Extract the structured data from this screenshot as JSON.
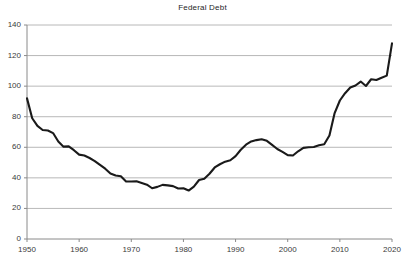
{
  "chart_data": {
    "type": "line",
    "title": "Federal Debt",
    "xlabel": "",
    "ylabel": "",
    "xlim": [
      1950,
      2020
    ],
    "ylim": [
      0,
      140
    ],
    "grid": true,
    "legend": "none",
    "xticks": [
      1950,
      1960,
      1970,
      1980,
      1990,
      2000,
      2010,
      2020
    ],
    "yticks": [
      0,
      20,
      40,
      60,
      80,
      100,
      120,
      140
    ],
    "xtick_labels": [
      "1950",
      "1960",
      "1970",
      "1980",
      "1990",
      "2000",
      "2010",
      "2020"
    ],
    "ytick_labels": [
      "0",
      "20",
      "40",
      "60",
      "80",
      "100",
      "120",
      "140"
    ],
    "series": [
      {
        "name": "Federal Debt",
        "color": "#1a1a1a",
        "x": [
          1950,
          1951,
          1952,
          1953,
          1954,
          1955,
          1956,
          1957,
          1958,
          1959,
          1960,
          1961,
          1962,
          1963,
          1964,
          1965,
          1966,
          1967,
          1968,
          1969,
          1970,
          1971,
          1972,
          1973,
          1974,
          1975,
          1976,
          1977,
          1978,
          1979,
          1980,
          1981,
          1982,
          1983,
          1984,
          1985,
          1986,
          1987,
          1988,
          1989,
          1990,
          1991,
          1992,
          1993,
          1994,
          1995,
          1996,
          1997,
          1998,
          1999,
          2000,
          2001,
          2002,
          2003,
          2004,
          2005,
          2006,
          2007,
          2008,
          2009,
          2010,
          2011,
          2012,
          2013,
          2014,
          2015,
          2016,
          2017,
          2018,
          2019,
          2020
        ],
        "values": [
          92.0,
          79.0,
          74.0,
          71.3,
          71.0,
          69.3,
          63.8,
          60.4,
          60.6,
          58.1,
          55.2,
          54.6,
          53.0,
          51.0,
          48.5,
          46.0,
          42.8,
          41.5,
          41.0,
          37.6,
          37.6,
          37.8,
          36.7,
          35.5,
          33.2,
          34.1,
          35.4,
          35.1,
          34.6,
          33.0,
          33.2,
          31.7,
          34.2,
          38.6,
          39.4,
          42.7,
          46.8,
          48.9,
          50.6,
          51.5,
          54.2,
          58.4,
          61.7,
          63.8,
          64.7,
          65.3,
          64.2,
          61.6,
          58.9,
          57.0,
          54.9,
          54.6,
          57.4,
          59.6,
          60.0,
          60.2,
          61.3,
          62.0,
          67.7,
          82.4,
          90.6,
          95.4,
          99.1,
          100.4,
          103.0,
          100.1,
          104.5,
          104.0,
          105.5,
          106.9,
          128.0
        ]
      }
    ]
  }
}
